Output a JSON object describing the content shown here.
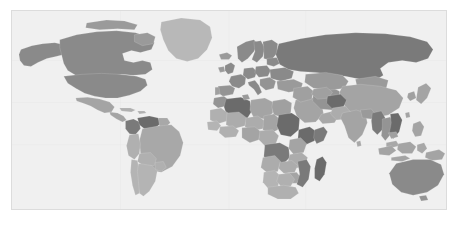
{
  "figure": {
    "type": "world-choropleth-map",
    "projection": "equirectangular",
    "frame": {
      "x": 11,
      "y": 10,
      "width": 436,
      "height": 200
    },
    "ocean_color": "#f0f0f0",
    "border_color": "#dcdcdc",
    "graticule_color": "#e4e4e4",
    "country_border_color": "#f0f0f0",
    "page_background": "#ffffff",
    "title": "",
    "legend": "",
    "axis_labels": []
  },
  "chart_data": {
    "type": "heatmap",
    "title": "",
    "subtitle": "",
    "xlabel": "",
    "ylabel": "",
    "legend_position": "none",
    "grid": true,
    "palette": {
      "very_light": "#d2d2d2",
      "light": "#c0c0c0",
      "medium_light": "#acacac",
      "medium": "#9a9a9a",
      "medium_dark": "#8a8a8a",
      "dark": "#7a7a7a",
      "very_dark": "#6b6b6b",
      "no_data": "#e8e8e8"
    },
    "categories": [
      "Canada",
      "United States",
      "Mexico",
      "Greenland",
      "Brazil",
      "Argentina",
      "Colombia",
      "Venezuela",
      "Peru",
      "Chile",
      "Bolivia",
      "Russia",
      "China",
      "India",
      "Kazakhstan",
      "Mongolia",
      "Iran",
      "Saudi Arabia",
      "Afghanistan",
      "Pakistan",
      "Myanmar",
      "Thailand",
      "Vietnam",
      "Indonesia",
      "Japan",
      "Algeria",
      "Libya",
      "Egypt",
      "Sudan",
      "Chad",
      "Niger",
      "Mali",
      "Nigeria",
      "Ethiopia",
      "Somalia",
      "Kenya",
      "Tanzania",
      "D.R. Congo",
      "Angola",
      "Namibia",
      "South Africa",
      "Madagascar",
      "Mozambique",
      "Zambia",
      "Zimbabwe",
      "Morocco",
      "France",
      "Germany",
      "Spain",
      "Italy",
      "Poland",
      "Ukraine",
      "Sweden",
      "Norway",
      "Finland",
      "United Kingdom",
      "Turkey",
      "Australia",
      "New Zealand",
      "Papua New Guinea"
    ],
    "values": [
      78,
      78,
      62,
      48,
      62,
      48,
      74,
      80,
      55,
      55,
      52,
      82,
      62,
      58,
      58,
      55,
      62,
      58,
      86,
      55,
      70,
      62,
      74,
      62,
      62,
      84,
      60,
      62,
      86,
      62,
      58,
      58,
      62,
      86,
      70,
      62,
      58,
      78,
      58,
      48,
      55,
      86,
      74,
      58,
      62,
      62,
      74,
      74,
      70,
      74,
      70,
      74,
      74,
      74,
      74,
      74,
      70,
      78,
      70,
      62
    ],
    "value_range": [
      40,
      90
    ],
    "value_unit": "shade-intensity"
  }
}
